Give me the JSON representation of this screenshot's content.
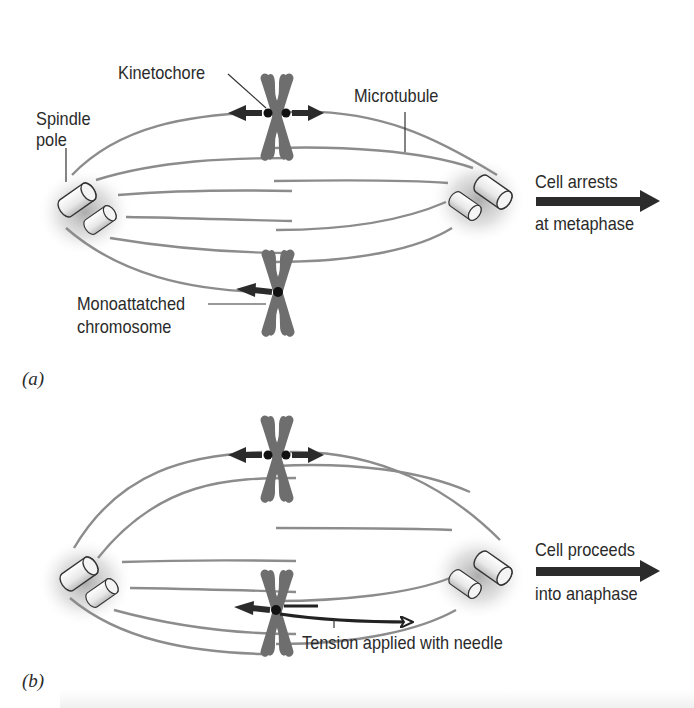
{
  "figure": {
    "panels": [
      {
        "id": "a",
        "label": "(a)",
        "labels": {
          "kinetochore": "Kinetochore",
          "spindle_pole_line1": "Spindle",
          "spindle_pole_line2": "pole",
          "microtubule": "Microtubule",
          "monoattached_line1": "Monoattatched",
          "monoattached_line2": "chromosome",
          "outcome_line1": "Cell arrests",
          "outcome_line2": "at metaphase"
        }
      },
      {
        "id": "b",
        "label": "(b)",
        "labels": {
          "needle": "Tension applied with needle",
          "outcome_line1": "Cell proceeds",
          "outcome_line2": "into anaphase"
        }
      }
    ],
    "colors": {
      "microtubule": "#8c8c8c",
      "chromosome": "#6e6e6e",
      "arrow": "#2b2b2b",
      "text": "#2a2a2a",
      "pole_glow": "#9a9a9a"
    }
  }
}
